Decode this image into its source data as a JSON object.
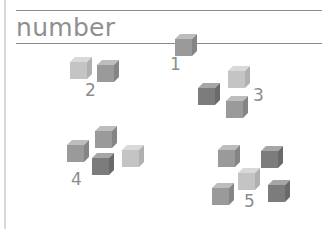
{
  "title": "number",
  "groups": [
    {
      "label": "1",
      "count": 1
    },
    {
      "label": "2",
      "count": 2
    },
    {
      "label": "3",
      "count": 3
    },
    {
      "label": "4",
      "count": 4
    },
    {
      "label": "5",
      "count": 5
    }
  ],
  "colors": {
    "rule": "#8a8a8a",
    "border": "#d9d9d9",
    "text": "#8f8f8f"
  }
}
